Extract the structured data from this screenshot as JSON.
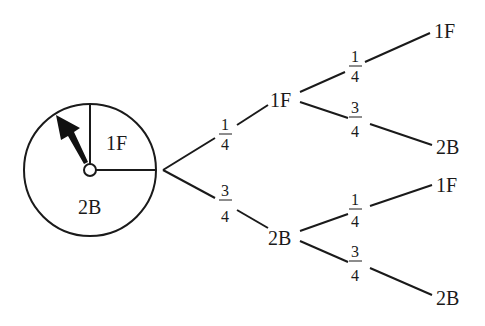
{
  "spinner": {
    "sections": [
      {
        "label": "1F",
        "fraction": "1/4"
      },
      {
        "label": "2B",
        "fraction": "3/4"
      }
    ]
  },
  "tree": {
    "level1": [
      {
        "outcome": "1F",
        "prob_num": "1",
        "prob_den": "4"
      },
      {
        "outcome": "2B",
        "prob_num": "3",
        "prob_den": "4"
      }
    ],
    "level2": [
      {
        "parent": "1F",
        "outcome": "1F",
        "prob_num": "1",
        "prob_den": "4"
      },
      {
        "parent": "1F",
        "outcome": "2B",
        "prob_num": "3",
        "prob_den": "4"
      },
      {
        "parent": "2B",
        "outcome": "1F",
        "prob_num": "1",
        "prob_den": "4"
      },
      {
        "parent": "2B",
        "outcome": "2B",
        "prob_num": "3",
        "prob_den": "4"
      }
    ]
  }
}
